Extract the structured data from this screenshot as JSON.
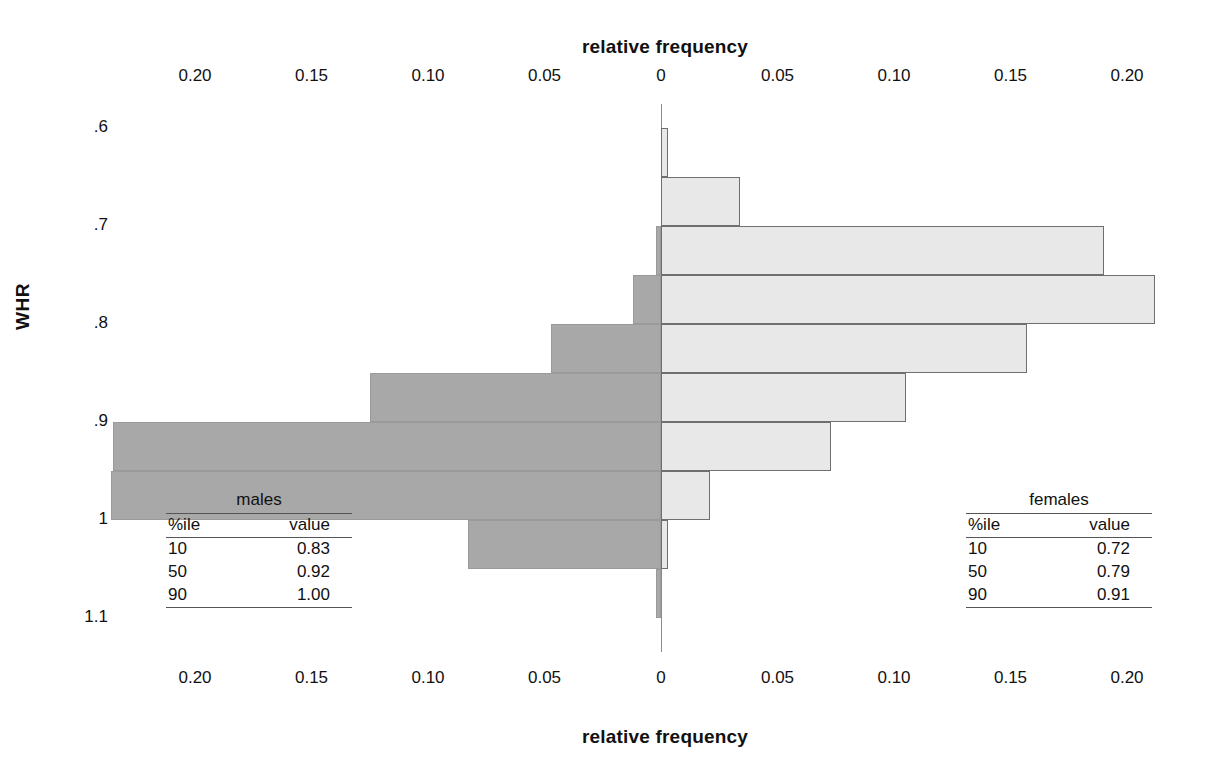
{
  "chart_data": {
    "type": "bar",
    "title": "",
    "orientation": "horizontal-back-to-back",
    "xlabel": "relative frequency",
    "ylabel": "WHR",
    "xlim": [
      -0.225,
      0.225
    ],
    "x_tick_values": [
      -0.2,
      -0.15,
      -0.1,
      -0.05,
      0,
      0.05,
      0.1,
      0.15,
      0.2
    ],
    "x_tick_labels": [
      "0.20",
      "0.15",
      "0.10",
      "0.05",
      "0",
      "0.05",
      "0.10",
      "0.15",
      "0.20"
    ],
    "y_tick_values": [
      0.6,
      0.7,
      0.8,
      0.9,
      1.0,
      1.1
    ],
    "y_tick_labels": [
      ".6",
      ".7",
      ".8",
      ".9",
      "1",
      "1.1"
    ],
    "ylim": [
      0.575,
      1.135
    ],
    "grid": false,
    "legend_position": "none",
    "bin_width": 0.05,
    "note": "males plotted to the left (dark gray), females to the right (light gray); bin midpoints ascend downward",
    "series": [
      {
        "name": "males",
        "color": "#a8a8a8",
        "side": "left",
        "bins": [
          0.6,
          0.65,
          0.7,
          0.75,
          0.8,
          0.85,
          0.9,
          0.95,
          1.0,
          1.05
        ],
        "values": [
          0.0,
          0.0,
          0.002,
          0.012,
          0.047,
          0.125,
          0.235,
          0.236,
          0.083,
          0.002
        ]
      },
      {
        "name": "females",
        "color": "#e8e8e8",
        "side": "right",
        "bins": [
          0.6,
          0.65,
          0.7,
          0.75,
          0.8,
          0.85,
          0.9,
          0.95,
          1.0,
          1.05
        ],
        "values": [
          0.003,
          0.034,
          0.19,
          0.212,
          0.157,
          0.105,
          0.073,
          0.021,
          0.003,
          0.0
        ]
      }
    ]
  },
  "axes": {
    "top_title": "relative frequency",
    "bottom_title": "relative frequency",
    "y_title": "WHR"
  },
  "tables": {
    "males": {
      "caption": "males",
      "headers": [
        "%ile",
        "value"
      ],
      "rows": [
        [
          "10",
          "0.83"
        ],
        [
          "50",
          "0.92"
        ],
        [
          "90",
          "1.00"
        ]
      ]
    },
    "females": {
      "caption": "females",
      "headers": [
        "%ile",
        "value"
      ],
      "rows": [
        [
          "10",
          "0.72"
        ],
        [
          "50",
          "0.79"
        ],
        [
          "90",
          "0.91"
        ]
      ]
    }
  },
  "colors": {
    "male_bar": "#a8a8a8",
    "female_bar": "#e8e8e8",
    "male_border": "#9a9a9a",
    "female_border": "#6f6f6f",
    "axis_line": "#8c8c8c",
    "text": "#111111"
  }
}
